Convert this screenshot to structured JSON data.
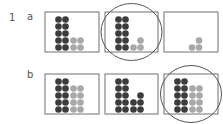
{
  "question": {
    "number": "1",
    "parts": [
      {
        "label": "a",
        "boxes": [
          {
            "dark": [
              5,
              5
            ],
            "gray": [
              2,
              2
            ],
            "circled": false
          },
          {
            "dark": [
              5,
              5
            ],
            "gray": [
              1,
              2
            ],
            "circled": true
          },
          {
            "dark": [],
            "gray": [
              1,
              2
            ],
            "circled": false
          }
        ]
      },
      {
        "label": "b",
        "boxes": [
          {
            "dark": [
              5,
              5
            ],
            "gray": [
              4,
              4
            ],
            "circled": false
          },
          {
            "dark": [
              5,
              5,
              2,
              3
            ],
            "gray": [],
            "circled": false
          },
          {
            "dark": [
              5,
              5
            ],
            "gray": [
              4,
              4
            ],
            "circled": true
          }
        ]
      }
    ]
  },
  "colors": {
    "dark_dot": "#3c3c3c",
    "gray_dot": "#a8a8a8",
    "box_stroke": "#707070",
    "circle_stroke": "#555555"
  }
}
